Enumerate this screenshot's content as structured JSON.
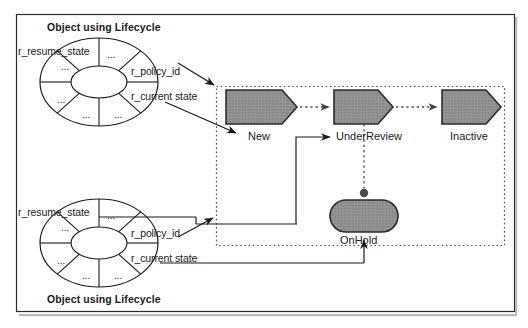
{
  "figure": {
    "kind": "state-lifecycle-diagram",
    "outer_frame": {
      "visible": true,
      "border_color": "#2b2b2b"
    },
    "lifecycle_container": {
      "name": "lifecycle-boundary",
      "style": "dotted",
      "border_color": "#555555"
    }
  },
  "objects": [
    {
      "id": "object-top",
      "title": "Object using Lifecycle",
      "title_position": "above",
      "attributes": [
        {
          "key": "resume",
          "label": "r_resume_state"
        },
        {
          "key": "policy",
          "label": "r_policy_id"
        },
        {
          "key": "current",
          "label": "r_current state"
        }
      ],
      "segment_placeholder": "...",
      "segment_count": 8
    },
    {
      "id": "object-bottom",
      "title": "Object using Lifecycle",
      "title_position": "below",
      "attributes": [
        {
          "key": "resume",
          "label": "r_resume_state"
        },
        {
          "key": "policy",
          "label": "r_policy_id"
        },
        {
          "key": "current",
          "label": "r_current state"
        }
      ],
      "segment_placeholder": "...",
      "segment_count": 8
    }
  ],
  "states": [
    {
      "id": "new",
      "label": "New",
      "shape": "chevron",
      "fill": "#8f8f8f"
    },
    {
      "id": "underreview",
      "label": "UnderReview",
      "shape": "chevron",
      "fill": "#8f8f8f"
    },
    {
      "id": "inactive",
      "label": "Inactive",
      "shape": "chevron",
      "fill": "#8f8f8f"
    },
    {
      "id": "onhold",
      "label": "OnHold",
      "shape": "rounded-rect",
      "fill": "#8f8f8f"
    }
  ],
  "transitions": [
    {
      "from": "new",
      "to": "underreview",
      "style": "dotted"
    },
    {
      "from": "underreview",
      "to": "inactive",
      "style": "dotted"
    },
    {
      "from": "underreview",
      "to": "onhold",
      "style": "dotted-anchor"
    }
  ],
  "links": [
    {
      "from": "object-top.r_policy_id",
      "to": "lifecycle-boundary",
      "style": "solid-arrow"
    },
    {
      "from": "object-top.r_current_state",
      "to": "new",
      "style": "solid-arrow"
    },
    {
      "from": "object-top.r_resume_state",
      "to": "underreview",
      "style": "solid-arrow"
    },
    {
      "from": "object-bottom.r_policy_id",
      "to": "lifecycle-boundary",
      "style": "solid-arrow"
    },
    {
      "from": "object-bottom.r_current_state",
      "to": "onhold",
      "style": "solid-arrow"
    }
  ],
  "colors": {
    "shape_fill": "#8f8f8f",
    "shape_stroke": "#2b2b2b",
    "line": "#1a1a1a",
    "dotted": "#555555",
    "text": "#1a1a1a"
  }
}
